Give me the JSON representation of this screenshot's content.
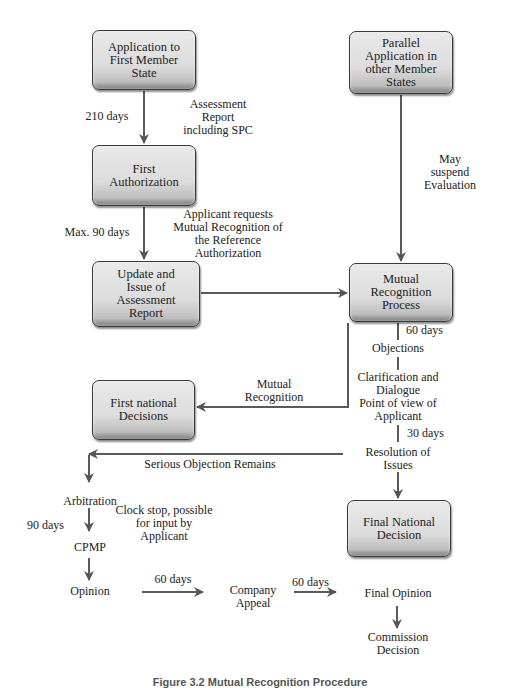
{
  "diagram": {
    "type": "flowchart",
    "boxes": {
      "application_first": "Application to First Member State",
      "first_authorization": "First Authorization",
      "update_issue": "Update and Issue of Assessment Report",
      "parallel_application": "Parallel Application in other Member States",
      "mutual_recognition_process": "Mutual Recognition Process",
      "first_national_decisions": "First national Decisions",
      "final_national_decision": "Final National Decision"
    },
    "labels": {
      "days_210": "210 days",
      "assessment_report": "Assessment\nReport\nincluding SPC",
      "max_90_days": "Max. 90 days",
      "applicant_requests": "Applicant requests\nMutual Recognition of\nthe Reference\nAuthorization",
      "may_suspend": "May\nsuspend\nEvaluation",
      "days_60_mrp": "60 days",
      "objections": "Objections",
      "clarification": "Clarification and\nDialogue\nPoint of view of\nApplicant",
      "days_30": "30 days",
      "mutual_recognition": "Mutual\nRecognition",
      "resolution": "Resolution of\nIssues",
      "serious_objection": "Serious Objection Remains",
      "arbitration": "Arbitration",
      "clock_stop": "Clock stop, possible\nfor  input by\nApplicant",
      "days_90": "90 days",
      "cpmp": "CPMP",
      "opinion": "Opinion",
      "days_60_a": "60 days",
      "company_appeal": "Company\nAppeal",
      "days_60_b": "60 days",
      "final_opinion": "Final Opinion",
      "commission_decision": "Commission\nDecision"
    },
    "caption": "Figure 3.2 Mutual Recognition Procedure"
  },
  "colors": {
    "line": "#5a5a5a",
    "box_fill": "#dcdcdc",
    "text": "#222222"
  }
}
